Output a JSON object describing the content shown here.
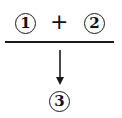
{
  "diagram": {
    "top": {
      "left_label": "1",
      "operator": "+",
      "right_label": "2"
    },
    "bottom": {
      "label": "3"
    },
    "colors": {
      "stroke": "#1a1a1a",
      "background": "#ffffff"
    }
  }
}
